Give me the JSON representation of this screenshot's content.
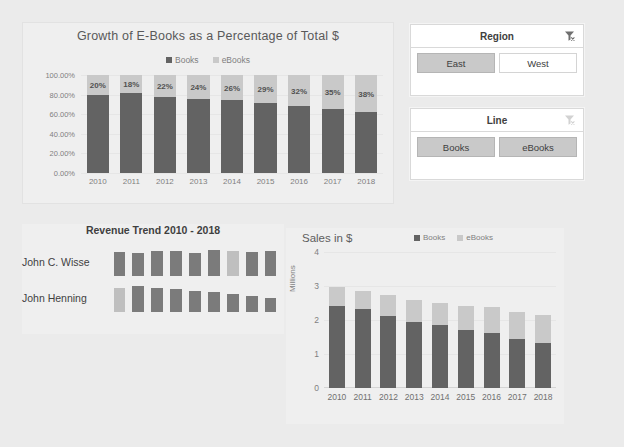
{
  "chart_data": [
    {
      "type": "bar",
      "id": "growth-percentage",
      "title": "Growth of E-Books as a Percentage of Total $",
      "stacked": "100%",
      "categories": [
        "2010",
        "2011",
        "2012",
        "2013",
        "2014",
        "2015",
        "2016",
        "2017",
        "2018"
      ],
      "series": [
        {
          "name": "Books",
          "color": "#636363",
          "values": [
            80,
            82,
            78,
            76,
            74,
            71,
            68,
            65,
            62
          ]
        },
        {
          "name": "eBooks",
          "color": "#c9c9c9",
          "values": [
            20,
            18,
            22,
            24,
            26,
            29,
            32,
            35,
            38
          ]
        }
      ],
      "data_labels": [
        "20%",
        "18%",
        "22%",
        "24%",
        "26%",
        "29%",
        "32%",
        "35%",
        "38%"
      ],
      "ytick_labels": [
        "100.00%",
        "80.00%",
        "60.00%",
        "40.00%",
        "20.00%",
        "0.00%"
      ],
      "ytick_values": [
        100,
        80,
        60,
        40,
        20,
        0
      ],
      "ylim": [
        0,
        100
      ],
      "xlabel": "",
      "ylabel": "",
      "grid": true,
      "legend_position": "top"
    },
    {
      "type": "bar",
      "id": "revenue-trend",
      "title": "Revenue Trend 2010 - 2018",
      "orientation": "sparkline-rows",
      "rows": [
        {
          "label": "John C. Wisse",
          "values": [
            0.74,
            0.72,
            0.76,
            0.78,
            0.72,
            0.8,
            0.78,
            0.74,
            0.76
          ],
          "highlight_index": 6
        },
        {
          "label": "John Henning",
          "values": [
            0.92,
            1.0,
            0.94,
            0.88,
            0.82,
            0.76,
            0.7,
            0.6,
            0.54
          ],
          "highlight_index": 0
        }
      ]
    },
    {
      "type": "bar",
      "id": "sales-in-dollars",
      "title": "Sales in $",
      "stacked": "value",
      "categories": [
        "2010",
        "2011",
        "2012",
        "2013",
        "2014",
        "2015",
        "2016",
        "2017",
        "2018"
      ],
      "series": [
        {
          "name": "Books",
          "color": "#636363",
          "values": [
            2.4,
            2.33,
            2.11,
            1.94,
            1.84,
            1.7,
            1.61,
            1.43,
            1.33
          ]
        },
        {
          "name": "eBooks",
          "color": "#c9c9c9",
          "values": [
            0.57,
            0.52,
            0.62,
            0.64,
            0.67,
            0.71,
            0.77,
            0.8,
            0.82
          ]
        }
      ],
      "ytick_labels": [
        "4",
        "3",
        "2",
        "1",
        "0"
      ],
      "ytick_values": [
        4,
        3,
        2,
        1,
        0
      ],
      "ylim": [
        0,
        4
      ],
      "ylabel": "Millions",
      "xlabel": "",
      "grid": true,
      "legend_position": "top"
    }
  ],
  "pct_chart": {
    "title": "Growth of E-Books as a Percentage of Total $",
    "legend": [
      {
        "label": "Books",
        "color": "#636363"
      },
      {
        "label": "eBooks",
        "color": "#c9c9c9"
      }
    ]
  },
  "slicers": [
    {
      "id": "region",
      "title": "Region",
      "clear_icon": "clear-filter-icon",
      "buttons": [
        {
          "label": "East",
          "selected": true
        },
        {
          "label": "West",
          "selected": false
        }
      ]
    },
    {
      "id": "line",
      "title": "Line",
      "clear_icon": "clear-filter-icon",
      "buttons": [
        {
          "label": "Books",
          "selected": true
        },
        {
          "label": "eBooks",
          "selected": true
        }
      ]
    }
  ],
  "trend_chart": {
    "title": "Revenue Trend 2010 - 2018"
  },
  "sales_chart": {
    "title": "Sales in $",
    "ylabel": "Millions",
    "legend": [
      {
        "label": "Books",
        "color": "#636363"
      },
      {
        "label": "eBooks",
        "color": "#c9c9c9"
      }
    ]
  },
  "colors": {
    "series_books": "#636363",
    "series_ebooks": "#c9c9c9",
    "canvas": "#ebebeb",
    "chart_bg": "#efefef",
    "slicer_selected": "#c9c9c9",
    "text": "#595959"
  }
}
